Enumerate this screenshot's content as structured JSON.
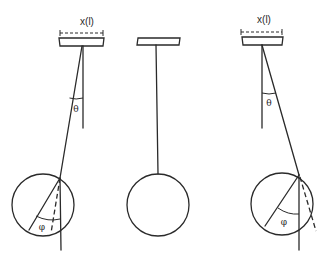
{
  "diagram": {
    "colors": {
      "ink": "#2a2a2a",
      "background": "#ffffff"
    },
    "panels": [
      {
        "id": "left",
        "dimension_label": "x(l)",
        "string_angle_label": "θ",
        "bob_angle_label": "φ",
        "tilt": "left"
      },
      {
        "id": "middle",
        "dimension_label": "",
        "string_angle_label": "",
        "bob_angle_label": "",
        "tilt": "none"
      },
      {
        "id": "right",
        "dimension_label": "x(l)",
        "string_angle_label": "θ",
        "bob_angle_label": "φ",
        "tilt": "right"
      }
    ]
  }
}
